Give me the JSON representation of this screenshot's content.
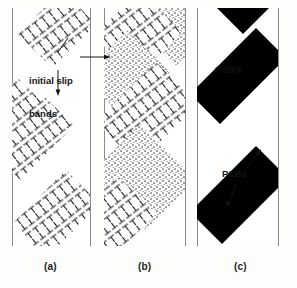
{
  "figure": {
    "width": 297,
    "height": 288,
    "background": "#ffffff",
    "type": "schematic-diagram"
  },
  "colors": {
    "ink": "#141414",
    "band_fill": "#000000",
    "grain_boundary": "#8a8a8a",
    "stipple": "#6f6f6f",
    "page": "#ffffff"
  },
  "annotations": {
    "initial_slip_bands": "initial slip\nbands",
    "initial_slip_bands_line1": "initial slip",
    "initial_slip_bands_line2": "bands",
    "matrix": "matrix",
    "psbs": "PSBs"
  },
  "panels": [
    {
      "id": "a",
      "caption": "(a)",
      "description": "Grain bounded by two vertical grain boundaries containing two diagonal bands of edge-dislocation symbols representing initial slip bands",
      "left": 12,
      "width": 78,
      "band_count": 2,
      "band_fill": "dislocation-hatch"
    },
    {
      "id": "b",
      "caption": "(b)",
      "description": "Grain containing alternating stippled ladder-structure bands and dislocation-hatched matrix bands",
      "left": 104,
      "width": 81,
      "band_count": 3,
      "band_fill": "stipple-and-dislocation-hatch"
    },
    {
      "id": "c",
      "caption": "(c)",
      "description": "Grain containing three solid black diagonal persistent slip bands separated by white matrix",
      "left": 197,
      "width": 81,
      "band_count": 3,
      "band_fill": "solid-black"
    }
  ],
  "captions": {
    "a": "(a)",
    "b": "(b)",
    "c": "(c)"
  },
  "legend_terms": [
    {
      "term": "initial slip bands",
      "points_to": "diagonal dislocation bands in panels (a) and (b)"
    },
    {
      "term": "matrix",
      "points_to": "white region between bands in panel (c)"
    },
    {
      "term": "PSBs",
      "points_to": "solid black diagonal bands in panel (c)"
    }
  ]
}
